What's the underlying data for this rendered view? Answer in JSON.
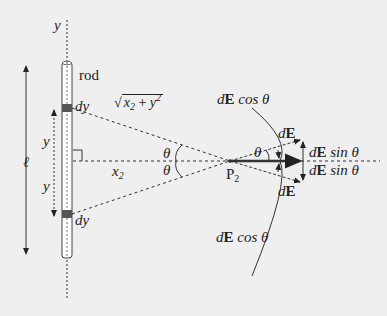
{
  "diagram": {
    "labels": {
      "y_axis": "y",
      "rod": "rod",
      "dy_top": "dy",
      "dy_bottom": "dy",
      "length": "ℓ",
      "y_upper": "y",
      "y_lower": "y",
      "x2_var": "x",
      "x2_sub": "2",
      "sqrt_x": "x",
      "sqrt_x_sub": "2",
      "sqrt_x_sup": "2",
      "sqrt_plus": "+",
      "sqrt_y": "y",
      "sqrt_y_sup": "2",
      "theta_upper": "θ",
      "theta_lower": "θ",
      "theta_right": "θ",
      "point": "P",
      "point_sub": "2",
      "dE_cos_top": "cos θ",
      "dE_cos_bottom": "cos θ",
      "dE_top": "E",
      "dE_bottom": "E",
      "dE_sin_top": "sin  θ",
      "dE_sin_bottom": "sin  θ",
      "d": "d",
      "E": "E"
    },
    "colors": {
      "line": "#333333",
      "rod_fill": "#ffffff",
      "dy_fill": "#555555",
      "background": "#efefef"
    }
  }
}
